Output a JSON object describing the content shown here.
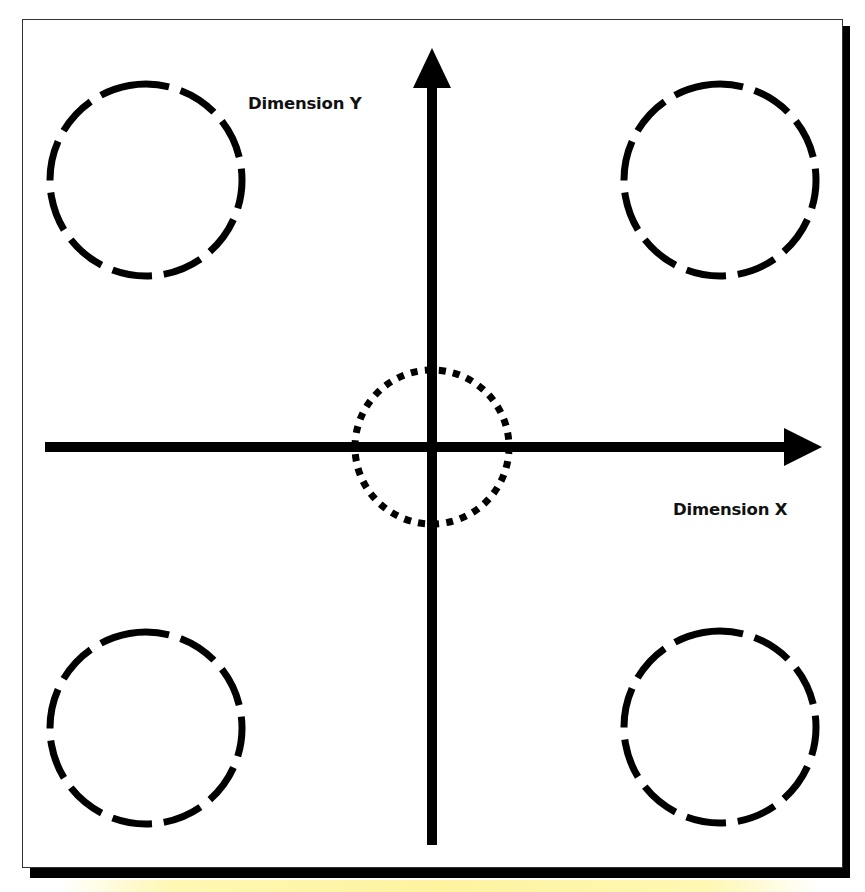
{
  "diagram": {
    "type": "two-dimensional axis diagram",
    "axes": {
      "x": {
        "label": "Dimension X",
        "direction": "right"
      },
      "y": {
        "label": "Dimension Y",
        "direction": "up"
      }
    },
    "quadrant_circles": [
      {
        "position": "top-left",
        "style": "dashed"
      },
      {
        "position": "top-right",
        "style": "dashed"
      },
      {
        "position": "bottom-left",
        "style": "dashed"
      },
      {
        "position": "bottom-right",
        "style": "dashed"
      }
    ],
    "center_circle": {
      "position": "origin",
      "style": "dotted"
    },
    "colors": {
      "stroke": "#000000",
      "background": "#ffffff",
      "frame_shadow": "#000000",
      "highlight": "#fff3a0"
    }
  }
}
